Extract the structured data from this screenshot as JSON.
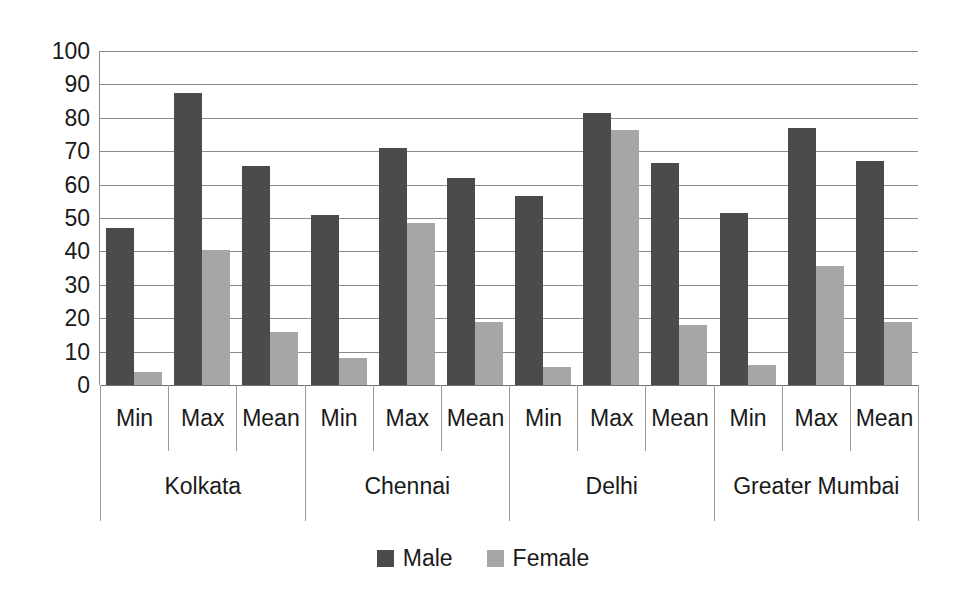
{
  "chart_data": {
    "type": "bar",
    "title": "",
    "subtitle": "",
    "xlabel": "",
    "ylabel": "",
    "ylim": [
      0,
      100
    ],
    "ytick_step": 10,
    "yticks": [
      100,
      90,
      80,
      70,
      60,
      50,
      40,
      30,
      20,
      10,
      0
    ],
    "grid": true,
    "legend_position": "bottom-center",
    "group_labels": [
      "Kolkata",
      "Chennai",
      "Delhi",
      "Greater Mumbai"
    ],
    "categories": [
      "Min",
      "Max",
      "Mean"
    ],
    "series": [
      {
        "name": "Male",
        "color": "#4b4b4b",
        "values_by_group": {
          "Kolkata": [
            47,
            87.5,
            65.5
          ],
          "Chennai": [
            51,
            71,
            62
          ],
          "Delhi": [
            56.5,
            81.5,
            66.5
          ],
          "Greater Mumbai": [
            51.5,
            77,
            67
          ]
        }
      },
      {
        "name": "Female",
        "color": "#a6a6a6",
        "values_by_group": {
          "Kolkata": [
            4,
            40.5,
            16
          ],
          "Chennai": [
            8,
            48.5,
            19
          ],
          "Delhi": [
            5.5,
            76.5,
            18
          ],
          "Greater Mumbai": [
            6,
            35.5,
            19
          ]
        }
      }
    ],
    "legend": [
      {
        "label": "Male",
        "color": "#4b4b4b",
        "swatch": "legend-swatch-male"
      },
      {
        "label": "Female",
        "color": "#a6a6a6",
        "swatch": "legend-swatch-female"
      }
    ],
    "colors": {
      "male": "#4b4b4b",
      "female": "#a6a6a6",
      "gridline": "#8a8a8a",
      "axis": "#9a9a9a",
      "text": "#1a1a1a",
      "background": "#ffffff"
    }
  }
}
